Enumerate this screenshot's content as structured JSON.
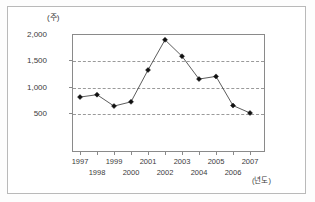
{
  "chart_data": {
    "type": "line",
    "title": "",
    "xlabel": "(년도)",
    "ylabel": "(주)",
    "y_unit_caption": "(주)",
    "x_unit_caption": "(년도)",
    "categories": [
      "1997",
      "1998",
      "1999",
      "2000",
      "2001",
      "2002",
      "2003",
      "2004",
      "2005",
      "2006",
      "2007"
    ],
    "values": [
      810,
      855,
      640,
      720,
      1320,
      1890,
      1580,
      1150,
      1200,
      650,
      510
    ],
    "series": [
      {
        "name": "value",
        "values": [
          810,
          855,
          640,
          720,
          1320,
          1890,
          1580,
          1150,
          1200,
          650,
          510
        ]
      }
    ],
    "ylim": [
      0,
      2000
    ],
    "yticks": [
      500,
      1000,
      1500,
      2000
    ],
    "ytick_labels": [
      "500",
      "1,000",
      "1,500",
      "2,000"
    ],
    "xticks": [
      "1997",
      "1998",
      "1999",
      "2000",
      "2001",
      "2002",
      "2003",
      "2004",
      "2005",
      "2006",
      "2007"
    ],
    "grid": true,
    "grid_style": "dashed-horizontal",
    "legend": null,
    "legend_position": "none",
    "marker": "filled-diamond",
    "line_color": "#4a4a4a",
    "marker_color": "#111111",
    "grid_color": "#9a9a9a",
    "axis_color": "#8a8a8a"
  },
  "axis": {
    "y_ticks": [
      {
        "label": "2,000",
        "value": 2000
      },
      {
        "label": "1,500",
        "value": 1500
      },
      {
        "label": "1,000",
        "value": 1000
      },
      {
        "label": "500",
        "value": 500
      }
    ],
    "x_ticks_row_top": [
      "1997",
      "1999",
      "2001",
      "2003",
      "2005",
      "2007"
    ],
    "x_ticks_row_bottom": [
      "1998",
      "2000",
      "2002",
      "2004",
      "2006"
    ]
  }
}
